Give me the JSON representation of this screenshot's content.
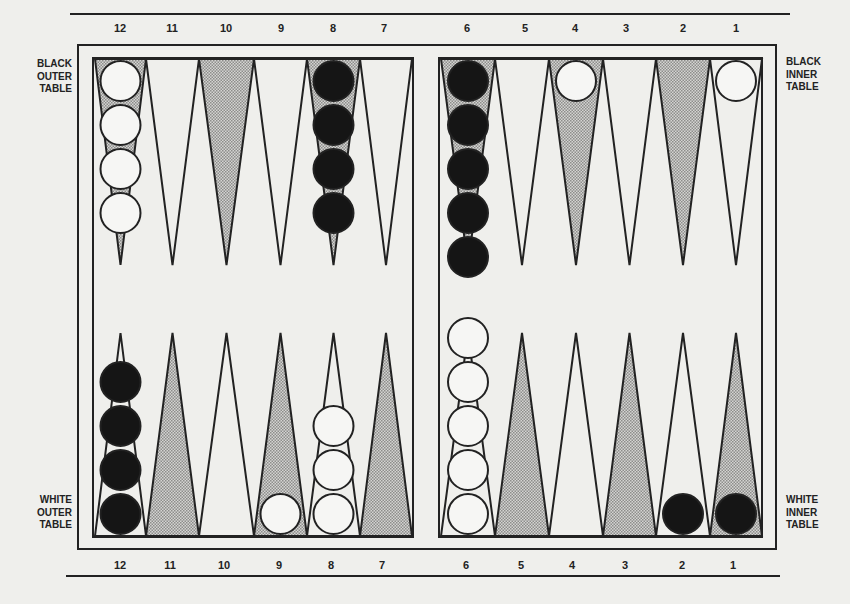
{
  "labels": {
    "top_left": [
      "BLACK",
      "OUTER",
      "TABLE"
    ],
    "top_right": [
      "BLACK",
      "INNER",
      "TABLE"
    ],
    "bottom_left": [
      "WHITE",
      "OUTER",
      "TABLE"
    ],
    "bottom_right": [
      "WHITE",
      "INNER",
      "TABLE"
    ]
  },
  "point_numbers": {
    "top": [
      "12",
      "11",
      "10",
      "9",
      "8",
      "7",
      "6",
      "5",
      "4",
      "3",
      "2",
      "1"
    ],
    "bottom": [
      "12",
      "11",
      "10",
      "9",
      "8",
      "7",
      "6",
      "5",
      "4",
      "3",
      "2",
      "1"
    ]
  },
  "colors": {
    "background": "#efefec",
    "line": "#222222",
    "shaded_point": "#bdbdbd",
    "black_checker": "#151515",
    "white_checker": "#f6f6f4"
  },
  "board": {
    "top_row": [
      {
        "point": "12",
        "shaded": true,
        "checkers": {
          "color": "white",
          "count": 4
        }
      },
      {
        "point": "11",
        "shaded": false,
        "checkers": {
          "color": "none",
          "count": 0
        }
      },
      {
        "point": "10",
        "shaded": true,
        "checkers": {
          "color": "none",
          "count": 0
        }
      },
      {
        "point": "9",
        "shaded": false,
        "checkers": {
          "color": "none",
          "count": 0
        }
      },
      {
        "point": "8",
        "shaded": true,
        "checkers": {
          "color": "black",
          "count": 4
        }
      },
      {
        "point": "7",
        "shaded": false,
        "checkers": {
          "color": "none",
          "count": 0
        }
      },
      {
        "point": "6",
        "shaded": true,
        "checkers": {
          "color": "black",
          "count": 5
        }
      },
      {
        "point": "5",
        "shaded": false,
        "checkers": {
          "color": "none",
          "count": 0
        }
      },
      {
        "point": "4",
        "shaded": true,
        "checkers": {
          "color": "white",
          "count": 1
        }
      },
      {
        "point": "3",
        "shaded": false,
        "checkers": {
          "color": "none",
          "count": 0
        }
      },
      {
        "point": "2",
        "shaded": true,
        "checkers": {
          "color": "none",
          "count": 0
        }
      },
      {
        "point": "1",
        "shaded": false,
        "checkers": {
          "color": "white",
          "count": 1
        }
      }
    ],
    "bottom_row": [
      {
        "point": "12",
        "shaded": false,
        "checkers": {
          "color": "black",
          "count": 4
        }
      },
      {
        "point": "11",
        "shaded": true,
        "checkers": {
          "color": "none",
          "count": 0
        }
      },
      {
        "point": "10",
        "shaded": false,
        "checkers": {
          "color": "none",
          "count": 0
        }
      },
      {
        "point": "9",
        "shaded": true,
        "checkers": {
          "color": "white",
          "count": 1
        }
      },
      {
        "point": "8",
        "shaded": false,
        "checkers": {
          "color": "white",
          "count": 3
        }
      },
      {
        "point": "7",
        "shaded": true,
        "checkers": {
          "color": "none",
          "count": 0
        }
      },
      {
        "point": "6",
        "shaded": false,
        "checkers": {
          "color": "white",
          "count": 5
        }
      },
      {
        "point": "5",
        "shaded": true,
        "checkers": {
          "color": "none",
          "count": 0
        }
      },
      {
        "point": "4",
        "shaded": false,
        "checkers": {
          "color": "none",
          "count": 0
        }
      },
      {
        "point": "3",
        "shaded": true,
        "checkers": {
          "color": "none",
          "count": 0
        }
      },
      {
        "point": "2",
        "shaded": false,
        "checkers": {
          "color": "black",
          "count": 1
        }
      },
      {
        "point": "1",
        "shaded": true,
        "checkers": {
          "color": "black",
          "count": 1
        }
      }
    ]
  }
}
